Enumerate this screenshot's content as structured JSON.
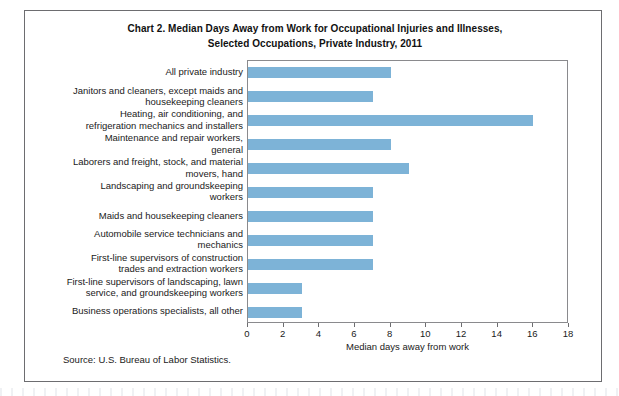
{
  "chart_data": {
    "type": "bar",
    "orientation": "horizontal",
    "title": "Chart 2. Median Days Away from Work for Occupational Injuries and Illnesses, Selected Occupations, Private Industry, 2011",
    "title_lines": [
      "Chart 2. Median Days Away from Work for Occupational Injuries and Illnesses,",
      "Selected Occupations, Private Industry, 2011"
    ],
    "categories": [
      "All private industry",
      "Janitors and cleaners, except maids and housekeeping cleaners",
      "Heating, air conditioning, and refrigeration mechanics and installers",
      "Maintenance and repair workers, general",
      "Laborers and freight, stock, and material movers, hand",
      "Landscaping and groundskeeping workers",
      "Maids and housekeeping cleaners",
      "Automobile service technicians and mechanics",
      "First-line supervisors of construction trades and extraction workers",
      "First-line supervisors of landscaping, lawn service, and groundskeeping workers",
      "Business operations specialists, all other"
    ],
    "category_label_lines": [
      [
        "All private industry"
      ],
      [
        "Janitors and cleaners, except maids and",
        "housekeeping cleaners"
      ],
      [
        "Heating, air conditioning, and",
        "refrigeration mechanics and installers"
      ],
      [
        "Maintenance and repair workers,",
        "general"
      ],
      [
        "Laborers and freight, stock, and material",
        "movers, hand"
      ],
      [
        "Landscaping and groundskeeping",
        "workers"
      ],
      [
        "Maids and housekeeping cleaners"
      ],
      [
        "Automobile service technicians and",
        "mechanics"
      ],
      [
        "First-line supervisors of construction",
        "trades and extraction workers"
      ],
      [
        "First-line supervisors of landscaping, lawn",
        "service, and groundskeeping workers"
      ],
      [
        "Business operations specialists, all other"
      ]
    ],
    "values": [
      8,
      7,
      16,
      8,
      9,
      7,
      7,
      7,
      7,
      3,
      3
    ],
    "xlabel": "Median days away from work",
    "ylabel": "",
    "xlim": [
      0,
      18
    ],
    "xticks": [
      0,
      2,
      4,
      6,
      8,
      10,
      12,
      14,
      16,
      18
    ],
    "xtick_labels": [
      "0",
      "2",
      "4",
      "6",
      "8",
      "10",
      "12",
      "14",
      "16",
      "18"
    ],
    "grid": false,
    "legend": false,
    "bar_color": "#7db3d7",
    "axis_color": "#8a8a8d",
    "source": "Source: U.S. Bureau of Labor Statistics."
  },
  "footer": {
    "source_note": "Source: U.S. Bureau of Labor Statistics."
  }
}
